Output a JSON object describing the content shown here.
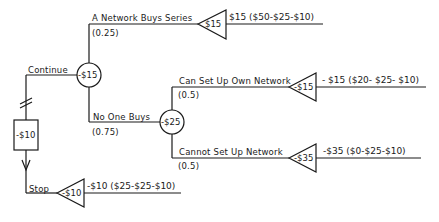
{
  "diagram": {
    "type": "decision-tree",
    "decision": {
      "box_value": "-$10",
      "options": [
        "Continue",
        "Stop"
      ]
    },
    "chance_node_1": {
      "value": "-$15",
      "branches": [
        {
          "label": "A Network Buys Series",
          "prob": "(0.25)",
          "terminal_value": "$15",
          "outcome": "$15 ($50-$25-$10)"
        },
        {
          "label": "No One Buys",
          "prob": "(0.75)"
        }
      ]
    },
    "chance_node_2": {
      "value": "-$25",
      "branches": [
        {
          "label": "Can Set Up Own Network",
          "prob": "(0.5)",
          "terminal_value": "-$15",
          "outcome": "- $15 ($20- $25- $10)"
        },
        {
          "label": "Cannot Set Up Network",
          "prob": "(0.5)",
          "terminal_value": "-$35",
          "outcome": "-$35 ($0-$25-$10)"
        }
      ]
    },
    "stop": {
      "terminal_value": "-$10",
      "outcome": "-$10 ($25-$25-$10)"
    }
  }
}
